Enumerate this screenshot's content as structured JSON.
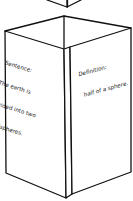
{
  "figure": {
    "type": "folded paper vocabulary foldable (3D tri-fold illustration)",
    "left_panel": {
      "heading": "Sentence:",
      "lines": [
        "The earth is",
        "divided into two",
        "hemispheres."
      ]
    },
    "right_panel": {
      "heading": "Definition:",
      "lines": [
        "half of a sphere."
      ]
    },
    "colors": {
      "stroke": "#111111",
      "paper": "#ffffff",
      "text": "#1a1a1a"
    }
  }
}
